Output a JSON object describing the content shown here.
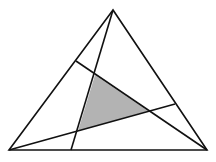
{
  "diagram": {
    "width": 216,
    "height": 162,
    "background": "#ffffff",
    "stroke_color": "#111111",
    "stroke_width": 1.6,
    "shade_color": "#b3b3b3",
    "outer_triangle": {
      "vertices": [
        [
          113,
          10
        ],
        [
          9,
          150
        ],
        [
          207,
          150
        ]
      ]
    },
    "cevians": [
      {
        "from": [
          113,
          10
        ],
        "to": [
          71,
          150
        ]
      },
      {
        "from": [
          9,
          150
        ],
        "to": [
          175,
          104
        ]
      },
      {
        "from": [
          207,
          150
        ],
        "to": [
          76,
          61
        ]
      }
    ],
    "shaded_triangle": {
      "vertices": [
        [
          95,
          75
        ],
        [
          148,
          111
        ],
        [
          78,
          131
        ]
      ]
    }
  }
}
